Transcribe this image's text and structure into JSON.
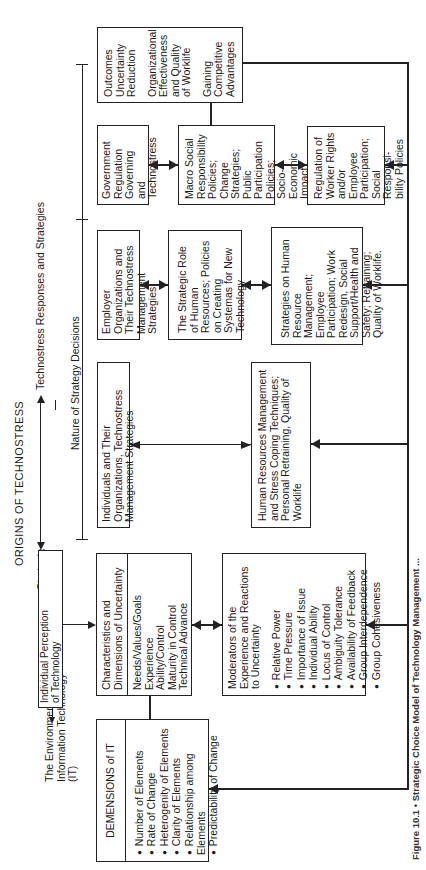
{
  "title": "ORIGINS OF TECHNOSTRESS",
  "top_labels": {
    "responses": "Technostress Responses and Strategies",
    "nature": "Nature of Strategy Decisions",
    "strategic_values": [
      "Strategic",
      "Values"
    ],
    "environment": [
      "The Environment of",
      "Information Technology",
      "(IT)"
    ],
    "perception": [
      "Individual Perception",
      "of Technology"
    ]
  },
  "boxes": {
    "dimensions": {
      "title": "DEMENSIONS of IT",
      "items": [
        "Number of Elements",
        "Rate of Change",
        "Heterogenity of Elements",
        "Clarity of Elements",
        "Relationship among Elements",
        "Predictability of Change"
      ]
    },
    "characteristics": {
      "title": "Characteristics and Dimensions of Uncertainty",
      "items": [
        "Needs/Values/Goals",
        "Experience",
        "Ability/Control",
        "Maturity in Control",
        "Technical Advance"
      ]
    },
    "moderators": {
      "title": "Moderators of the Experience and Reactions to Uncertainty",
      "items": [
        "Relative Power",
        "Time Pressure",
        "Importance of Issue",
        "Individual Ability",
        "Locus of Control",
        "Ambiguity Tolerance",
        "Availability of Feedback",
        "Group Interdependence",
        "Group Cohesiveness"
      ]
    },
    "individuals": "Individuals and Their Organizations, Technostress Management Strategies",
    "hr_stress": "Human Resources Management and Stress Coping Techniques; Personal Retraining, Quality of Worklife",
    "employer": "Employer Organizations and Their Technostress Management Strategies",
    "strategic_role": "The Strategic Role of Human Resources; Policies on Creating Systemas for New Technology",
    "strategies_hr": "Strategies on Human Resource Management; Employee Participation; Work Redesign, Social Support/Health and Safety; Retraining; Quality of Worklife.",
    "government": "Government Regulation Governing and Technostress",
    "macro": "Macro Social Responsibility Policies; Change Strategies; Public Participation Policies; Socio-Economic Impact Assessment",
    "worker_rights": "Regulation of Worker Rights and/or Employee Participation; Social Responsi-bility Policies",
    "outcomes": [
      "Outcomes Uncertainty Reduction",
      "Organizational Effectiveness and Quality of Worklife",
      "Gaining Competitive Advantages"
    ]
  },
  "caption": "Figure 10.1 • Strategic Choice Model of Technology Management ...",
  "colors": {
    "ink": "#222222",
    "background": "#ffffff"
  }
}
